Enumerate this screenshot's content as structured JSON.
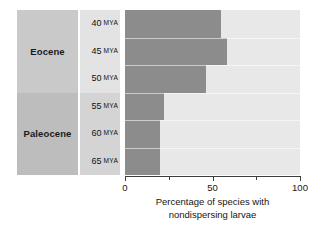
{
  "chart_data": {
    "type": "bar",
    "orientation": "horizontal",
    "stacked": true,
    "title": "",
    "xlabel_line1": "Percentage of species with",
    "xlabel_line2": "nondispersing larvae",
    "ylabel": "",
    "xlim": [
      0,
      100
    ],
    "xticks": [
      0,
      25,
      50,
      75,
      100
    ],
    "xticklabels": [
      "0",
      "",
      "50",
      "",
      "100"
    ],
    "labeled_xticks": [
      "0",
      "50",
      "100"
    ],
    "grid": false,
    "legend": "none",
    "categories": [
      "40 MYA",
      "45 MYA",
      "50 MYA",
      "55 MYA",
      "60 MYA",
      "65 MYA"
    ],
    "series": [
      {
        "name": "Nondispersing larvae",
        "color": "#8c8c8c",
        "values": [
          55,
          58,
          46,
          22,
          20,
          20
        ]
      },
      {
        "name": "Remainder",
        "color": "#e8e8e8",
        "values": [
          45,
          42,
          54,
          78,
          80,
          80
        ]
      }
    ]
  },
  "epochs": [
    {
      "label": "Eocene",
      "rows": [
        0,
        1,
        2
      ],
      "color": "#c9c9c9"
    },
    {
      "label": "Paleocene",
      "rows": [
        3,
        4,
        5
      ],
      "color": "#bdbdbd"
    }
  ],
  "mya_rows": [
    {
      "value": "40",
      "unit": "MYA",
      "band_color": "#e3e3e3"
    },
    {
      "value": "45",
      "unit": "MYA",
      "band_color": "#e3e3e3"
    },
    {
      "value": "50",
      "unit": "MYA",
      "band_color": "#e3e3e3"
    },
    {
      "value": "55",
      "unit": "MYA",
      "band_color": "#d4d4d4"
    },
    {
      "value": "60",
      "unit": "MYA",
      "band_color": "#d4d4d4"
    },
    {
      "value": "65",
      "unit": "MYA",
      "band_color": "#d4d4d4"
    }
  ],
  "colors": {
    "bar_dark": "#8c8c8c",
    "bar_light": "#e8e8e8",
    "epoch_eocene": "#c9c9c9",
    "epoch_paleocene": "#bdbdbd",
    "mya_band_top": "#e3e3e3",
    "mya_band_bottom": "#d4d4d4",
    "axis": "#3d3d3d",
    "text": "#151515",
    "background": "#ffffff"
  }
}
